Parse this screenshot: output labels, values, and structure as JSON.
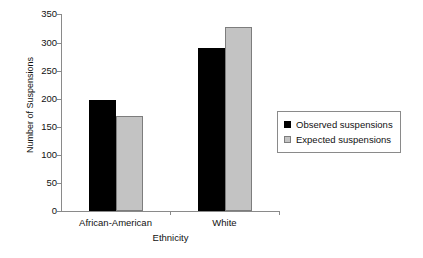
{
  "chart_data": {
    "type": "bar",
    "title": "",
    "xlabel": "Ethnicity",
    "ylabel": "Number of Suspensions",
    "categories": [
      "African-American",
      "White"
    ],
    "series": [
      {
        "name": "Observed suspensions",
        "values": [
          198,
          290
        ],
        "color": "#000000"
      },
      {
        "name": "Expected suspensions",
        "values": [
          168,
          327
        ],
        "color": "#c3c3c3"
      }
    ],
    "ylim": [
      0,
      350
    ],
    "ytick_values": [
      0,
      50,
      100,
      150,
      200,
      250,
      300,
      350
    ],
    "ytick_labels": [
      "0",
      "50",
      "100",
      "150",
      "200",
      "250",
      "300",
      "350"
    ],
    "grid": false,
    "legend_position": "right"
  },
  "legend": {
    "entries": [
      {
        "label": "Observed suspensions",
        "swatch": "observed-swatch"
      },
      {
        "label": "Expected suspensions",
        "swatch": "expected-swatch"
      }
    ]
  },
  "axes": {
    "y_title": "Number of Suspensions",
    "x_title": "Ethnicity"
  }
}
